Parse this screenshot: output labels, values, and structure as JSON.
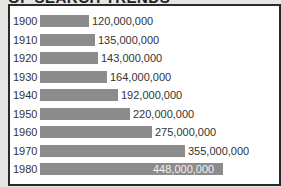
{
  "title": "OF SEARCH TRENDS",
  "chart_data": {
    "type": "bar",
    "orientation": "horizontal",
    "title": "OF SEARCH TRENDS",
    "categories": [
      "1900",
      "1910",
      "1920",
      "1930",
      "1940",
      "1950",
      "1960",
      "1970",
      "1980"
    ],
    "values": [
      120000000,
      135000000,
      143000000,
      164000000,
      192000000,
      220000000,
      275000000,
      355000000,
      448000000
    ],
    "labels": [
      "120,000,000",
      "135,000,000",
      "143,000,000",
      "164,000,000",
      "192,000,000",
      "220,000,000",
      "275,000,000",
      "355,000,000",
      "448,000,000"
    ],
    "xlabel": "",
    "ylabel": "",
    "grid": false,
    "bar_color": "#8c8c8c"
  }
}
